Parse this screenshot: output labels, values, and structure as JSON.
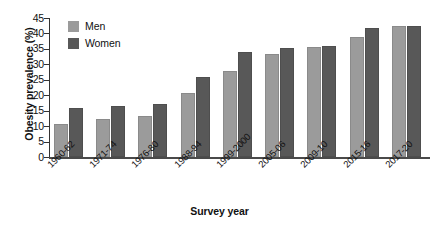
{
  "chart_data": {
    "type": "bar",
    "title": "",
    "xlabel": "Survey year",
    "ylabel": "Obesity prevalence (%)",
    "ylim": [
      0,
      45
    ],
    "yticks": [
      0,
      5,
      10,
      15,
      20,
      25,
      30,
      35,
      40,
      45
    ],
    "grid": false,
    "legend_position": "top-left",
    "categories": [
      "1960-62",
      "1971-74",
      "1976-80",
      "1988-94",
      "1999-2000",
      "2005-06",
      "2009-10",
      "2015-16",
      "2017-20"
    ],
    "series": [
      {
        "name": "Men",
        "color": "#9b9b9b",
        "values": [
          10.7,
          12.2,
          13.4,
          20.6,
          27.7,
          33.3,
          35.5,
          38.7,
          42.4
        ]
      },
      {
        "name": "Women",
        "color": "#585858",
        "values": [
          15.9,
          16.6,
          17.1,
          25.9,
          34.0,
          35.4,
          35.8,
          41.9,
          42.4
        ]
      }
    ]
  }
}
